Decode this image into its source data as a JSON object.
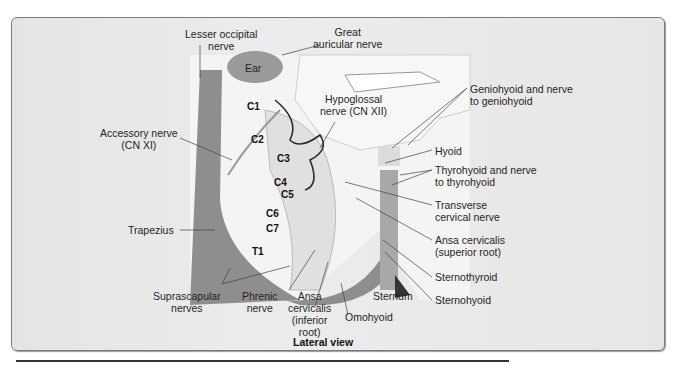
{
  "figure": {
    "caption_view": "Lateral view",
    "colors": {
      "muscle": "#8e8e8e",
      "bone": "#e8e8e8",
      "nerve": "#b9b9b9",
      "hypoglossal": "#2b2b2b",
      "background": "#e8e8e8"
    },
    "labels": {
      "lesser_occipital": "Lesser occipital\nnerve",
      "great_auricular": "Great\nauricular nerve",
      "ear": "Ear",
      "hypoglossal": "Hypoglossal\nnerve (CN XII)",
      "geniohyoid": "Geniohyoid and nerve\nto geniohyoid",
      "hyoid": "Hyoid",
      "thyrohyoid": "Thyrohyoid and nerve\nto thyrohyoid",
      "transverse_cervical": "Transverse\ncervical nerve",
      "ansa_superior": "Ansa cervicalis\n(superior root)",
      "sternothyroid": "Sternothyroid",
      "sternohyoid": "Sternohyoid",
      "sternum": "Sternum",
      "omohyoid": "Omohyoid",
      "ansa_inferior": "Ansa\ncervicalis\n(inferior\nroot)",
      "phrenic": "Phrenic\nnerve",
      "suprascapular": "Suprascapular\nnerves",
      "trapezius": "Trapezius",
      "accessory": "Accessory nerve\n(CN XI)"
    },
    "vertebrae": [
      "C1",
      "C2",
      "C3",
      "C4",
      "C5",
      "C6",
      "C7",
      "T1"
    ]
  }
}
